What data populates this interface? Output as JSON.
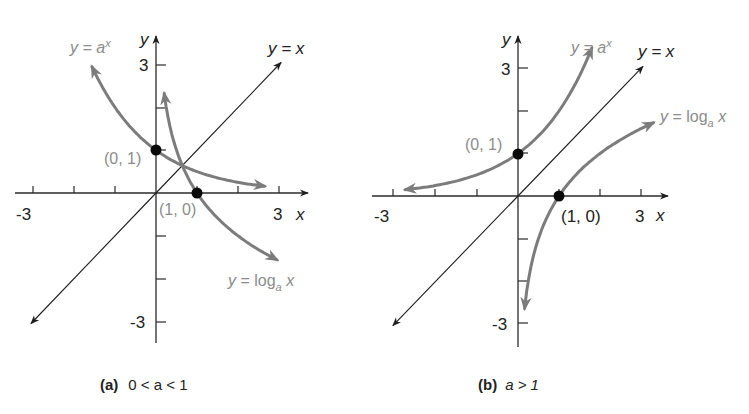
{
  "chart_data": [
    {
      "type": "line",
      "panel": "a",
      "caption_letter": "(a)",
      "caption_condition": "0 < a < 1",
      "xlabel": "x",
      "ylabel": "y",
      "xlim": [
        -3,
        3
      ],
      "ylim": [
        -3,
        3
      ],
      "x_tick_labels": [
        "-3",
        "3"
      ],
      "y_tick_labels": [
        "3",
        "-3"
      ],
      "ticks": [
        -3,
        -2,
        -1,
        1,
        2,
        3
      ],
      "series": [
        {
          "name": "y = a^x",
          "label_base": "y = a",
          "label_sup": "x",
          "base_a": 0.5,
          "x_range": [
            -1.56,
            2.65
          ],
          "color": "#7c7c7c"
        },
        {
          "name": "y = log_a x",
          "label_base": "y = log",
          "label_sub": "a",
          "label_tail": " x",
          "base_a": 0.5,
          "x_range": [
            0.2,
            2.95
          ],
          "color": "#7c7c7c"
        },
        {
          "name": "y = x",
          "label": "y = x",
          "x_range": [
            -3.05,
            3.05
          ],
          "color": "#1e1e1e"
        }
      ],
      "points": [
        {
          "label": "(0, 1)",
          "x": 0,
          "y": 1
        },
        {
          "label": "(1, 0)",
          "x": 1,
          "y": 0
        }
      ]
    },
    {
      "type": "line",
      "panel": "b",
      "caption_letter": "(b)",
      "caption_condition": "a > 1",
      "xlabel": "x",
      "ylabel": "y",
      "xlim": [
        -3,
        3
      ],
      "ylim": [
        -3,
        3
      ],
      "x_tick_labels": [
        "-3",
        "3"
      ],
      "y_tick_labels": [
        "3",
        "-3"
      ],
      "ticks": [
        -3,
        -2,
        -1,
        1,
        2,
        3
      ],
      "series": [
        {
          "name": "y = a^x",
          "label_base": "y = a",
          "label_sup": "x",
          "base_a": 2,
          "x_range": [
            -2.75,
            1.8
          ],
          "color": "#7c7c7c"
        },
        {
          "name": "y = log_a x",
          "label_base": "y = log",
          "label_sub": "a",
          "label_tail": " x",
          "base_a": 2,
          "x_range": [
            0.16,
            3.3
          ],
          "color": "#7c7c7c"
        },
        {
          "name": "y = x",
          "label": "y = x",
          "x_range": [
            -3.05,
            3.05
          ],
          "color": "#1e1e1e"
        }
      ],
      "points": [
        {
          "label": "(0, 1)",
          "x": 0,
          "y": 1
        },
        {
          "label": "(1, 0)",
          "x": 1,
          "y": 0
        }
      ]
    }
  ]
}
